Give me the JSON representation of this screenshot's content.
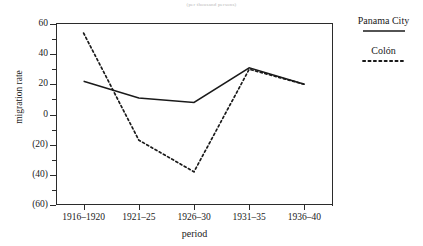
{
  "chart_data": {
    "type": "line",
    "title": "(per thousand persons)",
    "xlabel": "period",
    "ylabel": "migration rate",
    "categories": [
      "1916–1920",
      "1921–25",
      "1926–30",
      "1931–35",
      "1936–40"
    ],
    "ylim": [
      -60,
      60
    ],
    "yticks": [
      60,
      40,
      20,
      0,
      -20,
      -40,
      -60
    ],
    "ytick_labels": [
      "60",
      "40",
      "20",
      "0",
      "(20)",
      "(40)",
      "(60)"
    ],
    "yticks_minor": [
      50,
      30,
      10,
      -10,
      -30,
      -50
    ],
    "grid": false,
    "legend_position": "right",
    "series": [
      {
        "name": "Panama City",
        "style": "solid",
        "color": "#1a1a1a",
        "values": [
          22,
          11,
          8,
          31,
          20
        ]
      },
      {
        "name": "Colón",
        "style": "dotted",
        "color": "#1a1a1a",
        "values": [
          54,
          -17,
          -38,
          30,
          20
        ]
      }
    ]
  },
  "legend": {
    "entries": [
      {
        "label": "Panama City",
        "style": "solid"
      },
      {
        "label": "Colón",
        "style": "dotted"
      }
    ]
  }
}
